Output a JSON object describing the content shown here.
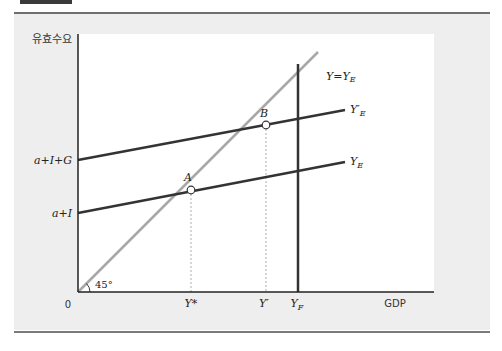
{
  "diagram": {
    "y_axis_label": "유효수요",
    "x_axis_label": "GDP",
    "origin_label": "0",
    "angle_label": "45°",
    "y_intercepts": [
      {
        "label": "a+I+G"
      },
      {
        "label": "a+I"
      }
    ],
    "x_ticks": [
      {
        "label": "Y*"
      },
      {
        "label": "Y′"
      },
      {
        "label": "Y",
        "sub": "F"
      }
    ],
    "curves": [
      {
        "name": "45-degree line",
        "label": "Y=Y",
        "sub": "E",
        "color": "#a8a8a8"
      },
      {
        "name": "expenditure with government",
        "label": "Y′",
        "sub": "E",
        "color": "#333333"
      },
      {
        "name": "expenditure",
        "label": "Y",
        "sub": "E",
        "color": "#333333"
      },
      {
        "name": "full employment output",
        "label": "Y",
        "sub": "F",
        "color": "#333333"
      }
    ],
    "points": [
      {
        "label": "A"
      },
      {
        "label": "B"
      }
    ]
  },
  "colors": {
    "panel_bg": "#eeeeee",
    "plot_bg": "#ffffff",
    "axis": "#222222",
    "line_dark": "#333333",
    "line_light": "#a8a8a8"
  }
}
